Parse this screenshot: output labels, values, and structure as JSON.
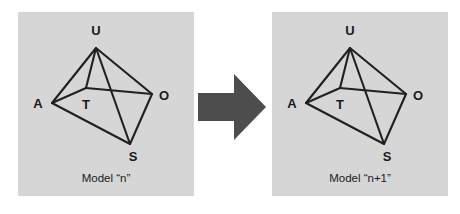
{
  "figure": {
    "background_color": "#ffffff",
    "panel_color": "#d6d6d6",
    "edge_color": "#231f20",
    "arrow_color": "#4d4d4d",
    "text_color": "#1a1a1a"
  },
  "arrow": {
    "icon": "right-arrow-icon",
    "direction": "right",
    "color": "#4d4d4d"
  },
  "models": [
    {
      "id": "model-n",
      "caption": "Model “n”",
      "vertices": [
        {
          "id": "U",
          "label": "U",
          "x": 78,
          "y": 36,
          "label_x": 78,
          "label_y": 18
        },
        {
          "id": "A",
          "label": "A",
          "x": 34,
          "y": 91,
          "label_x": 20,
          "label_y": 91
        },
        {
          "id": "T",
          "label": "T",
          "x": 68,
          "y": 76,
          "label_x": 68,
          "label_y": 92
        },
        {
          "id": "O",
          "label": "O",
          "x": 134,
          "y": 82,
          "label_x": 146,
          "label_y": 83
        },
        {
          "id": "S",
          "label": "S",
          "x": 112,
          "y": 132,
          "label_x": 115,
          "label_y": 144
        }
      ],
      "edges": [
        {
          "from": "U",
          "to": "A"
        },
        {
          "from": "U",
          "to": "T"
        },
        {
          "from": "U",
          "to": "O"
        },
        {
          "from": "U",
          "to": "S"
        },
        {
          "from": "A",
          "to": "T"
        },
        {
          "from": "T",
          "to": "O"
        },
        {
          "from": "A",
          "to": "S"
        },
        {
          "from": "S",
          "to": "O"
        }
      ]
    },
    {
      "id": "model-n-plus-1",
      "caption": "Model “n+1”",
      "vertices": [
        {
          "id": "U",
          "label": "U",
          "x": 78,
          "y": 36,
          "label_x": 78,
          "label_y": 18
        },
        {
          "id": "A",
          "label": "A",
          "x": 34,
          "y": 91,
          "label_x": 20,
          "label_y": 91
        },
        {
          "id": "T",
          "label": "T",
          "x": 68,
          "y": 76,
          "label_x": 68,
          "label_y": 92
        },
        {
          "id": "O",
          "label": "O",
          "x": 134,
          "y": 82,
          "label_x": 146,
          "label_y": 83
        },
        {
          "id": "S",
          "label": "S",
          "x": 112,
          "y": 132,
          "label_x": 115,
          "label_y": 144
        }
      ],
      "edges": [
        {
          "from": "U",
          "to": "A"
        },
        {
          "from": "U",
          "to": "T"
        },
        {
          "from": "U",
          "to": "O"
        },
        {
          "from": "U",
          "to": "S"
        },
        {
          "from": "A",
          "to": "T"
        },
        {
          "from": "T",
          "to": "O"
        },
        {
          "from": "A",
          "to": "S"
        },
        {
          "from": "S",
          "to": "O"
        }
      ]
    }
  ]
}
